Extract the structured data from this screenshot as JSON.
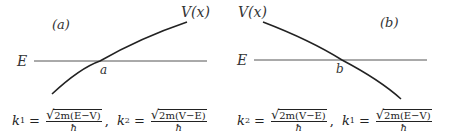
{
  "panel_a": {
    "tag": "(a)",
    "curve_label": "V(x)",
    "energy_label": "E",
    "turning_point": "a",
    "formula": {
      "k1_lhs": "k",
      "k1_sub": "1",
      "k1_radicand": "2m(E−V)",
      "k1_den": "ħ",
      "k2_lhs": "k",
      "k2_sub": "2",
      "k2_radicand": "2m(V−E)",
      "k2_den": "ħ"
    }
  },
  "panel_b": {
    "tag": "(b)",
    "curve_label": "V(x)",
    "energy_label": "E",
    "turning_point": "b",
    "formula": {
      "k2_lhs": "k",
      "k2_sub": "2",
      "k2_radicand": "2m(V−E)",
      "k2_den": "ħ",
      "k1_lhs": "k",
      "k1_sub": "1",
      "k1_radicand": "2m(E−V)",
      "k1_den": "ħ"
    }
  },
  "symbols": {
    "equals": "=",
    "comma": ",",
    "sqrt": "√"
  },
  "colors": {
    "line": "#222222",
    "energy_line": "#555555",
    "text": "#333333"
  }
}
